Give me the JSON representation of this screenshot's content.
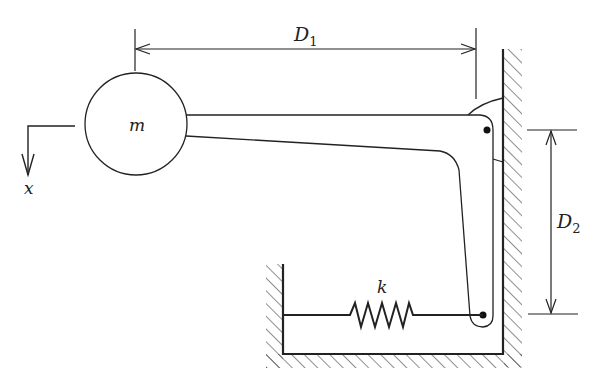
{
  "diagram": {
    "type": "mechanical-system",
    "labels": {
      "mass": "m",
      "spring": "k",
      "axis": "x",
      "d1_main": "D",
      "d1_sub": "1",
      "d2_main": "D",
      "d2_sub": "2"
    },
    "colors": {
      "stroke": "#222222",
      "background": "#ffffff"
    },
    "components": [
      {
        "id": "mass",
        "label": "m",
        "shape": "circle"
      },
      {
        "id": "lever",
        "shape": "L-shaped bell crank"
      },
      {
        "id": "pivot",
        "shape": "pin joint at wall"
      },
      {
        "id": "spring",
        "label": "k",
        "shape": "zigzag"
      },
      {
        "id": "wall",
        "shape": "hatched ground"
      },
      {
        "id": "dimension-D1",
        "label": "D1"
      },
      {
        "id": "dimension-D2",
        "label": "D2"
      },
      {
        "id": "axis-x",
        "label": "x",
        "direction": "down"
      }
    ]
  }
}
